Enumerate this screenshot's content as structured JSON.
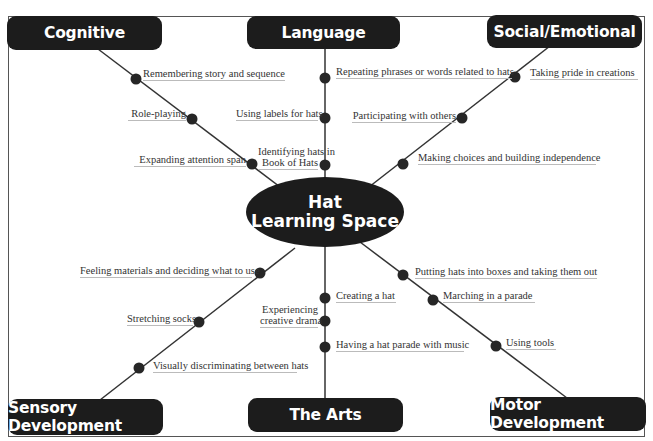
{
  "center": {
    "line1": "Hat",
    "line2": "Learning Space"
  },
  "categories": {
    "cognitive": {
      "title": "Cognitive",
      "items": [
        "Remembering story and sequence",
        "Role-playing",
        "Expanding attention span"
      ]
    },
    "language": {
      "title": "Language",
      "items": [
        "Repeating phrases or words related to hats",
        "Using labels for hats",
        "Identifying hats in",
        "Book of Hats"
      ]
    },
    "social": {
      "title": "Social/Emotional",
      "items": [
        "Taking pride in creations",
        "Participating with others",
        "Making choices and building independence"
      ]
    },
    "sensory": {
      "title": "Sensory Development",
      "items": [
        "Feeling materials and deciding what to use",
        "Stretching socks",
        "Visually discriminating between hats"
      ]
    },
    "arts": {
      "title": "The Arts",
      "items": [
        "Creating a hat",
        "Experiencing",
        "creative drama",
        "Having a hat parade with music"
      ]
    },
    "motor": {
      "title": "Motor Development",
      "items": [
        "Putting hats into boxes and taking them out",
        "Marching in a parade",
        "Using tools"
      ]
    }
  },
  "colors": {
    "node_fill": "#1c1c1c",
    "node_text": "#ffffff",
    "line": "#333333",
    "frame": "#555555"
  }
}
